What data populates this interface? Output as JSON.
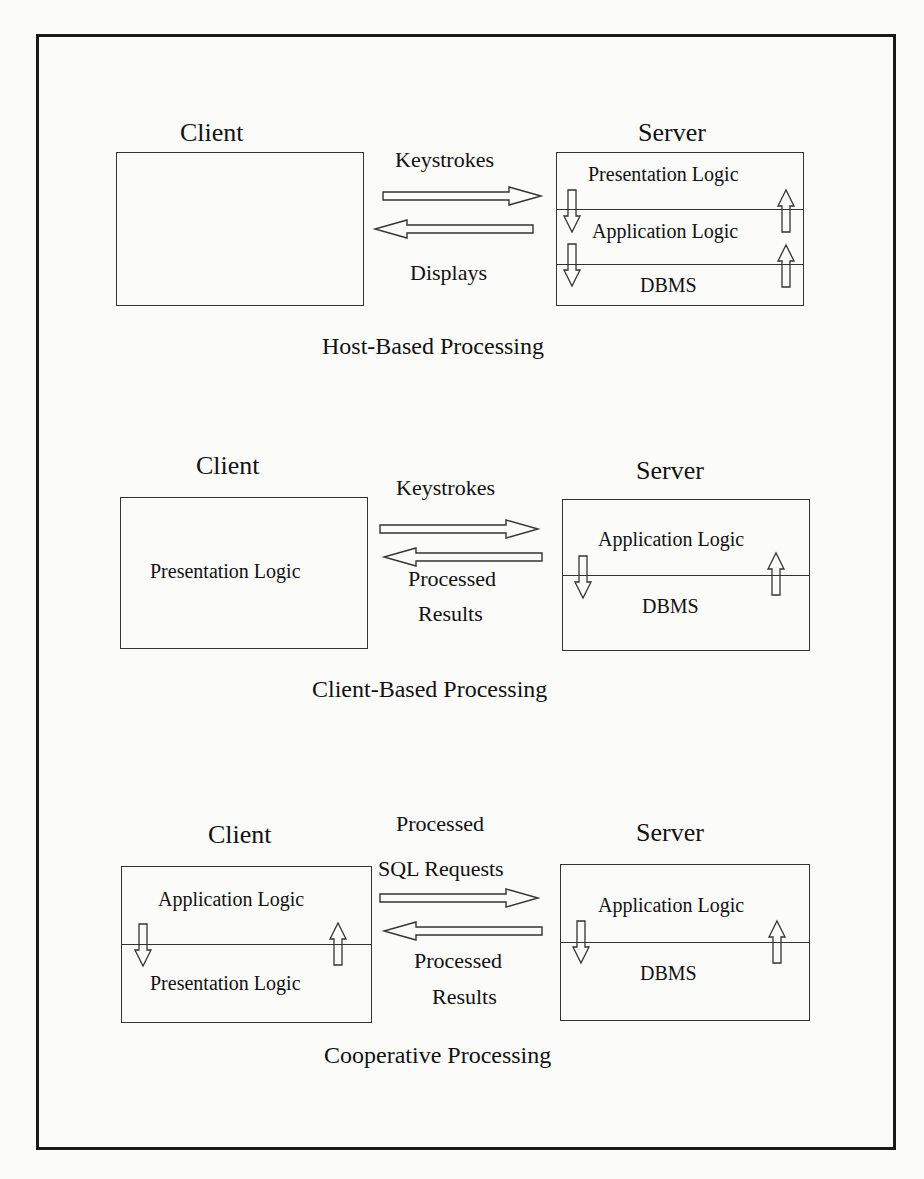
{
  "figure": {
    "panels": [
      {
        "caption": "Host-Based Processing",
        "client": {
          "title": "Client",
          "layers": []
        },
        "server": {
          "title": "Server",
          "layers": [
            "Presentation Logic",
            "Application Logic",
            "DBMS"
          ]
        },
        "to_server_label": [
          "Keystrokes"
        ],
        "to_client_label": [
          "Displays"
        ]
      },
      {
        "caption": "Client-Based Processing",
        "client": {
          "title": "Client",
          "layers": [
            "Presentation Logic"
          ]
        },
        "server": {
          "title": "Server",
          "layers": [
            "Application Logic",
            "DBMS"
          ]
        },
        "to_server_label": [
          "Keystrokes"
        ],
        "to_client_label": [
          "Processed",
          "Results"
        ]
      },
      {
        "caption": "Cooperative Processing",
        "client": {
          "title": "Client",
          "layers": [
            "Application Logic",
            "Presentation Logic"
          ]
        },
        "server": {
          "title": "Server",
          "layers": [
            "Application Logic",
            "DBMS"
          ]
        },
        "to_server_label": [
          "Processed",
          "SQL Requests"
        ],
        "to_client_label": [
          "Processed",
          "Results"
        ]
      }
    ],
    "colors": {
      "line": "#333333",
      "frame": "#1a1a1a",
      "paper": "#fbfbfa",
      "text": "#111111"
    }
  }
}
